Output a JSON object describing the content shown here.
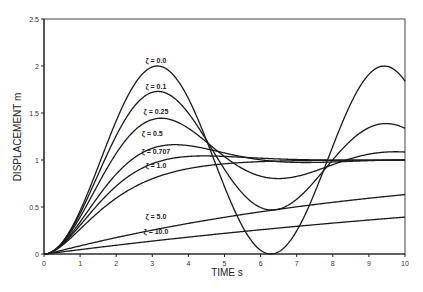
{
  "chart_data": {
    "type": "line",
    "title": "",
    "xlabel": "TIME s",
    "ylabel": "DISPLACEMENT m",
    "xlim": [
      0,
      10
    ],
    "ylim": [
      0,
      2.5
    ],
    "x_ticks": [
      "0",
      "1",
      "2",
      "3",
      "4",
      "5",
      "6",
      "7",
      "8",
      "9",
      "10"
    ],
    "y_ticks": [
      "0",
      "0.5",
      "1",
      "1.5",
      "2",
      "2.5"
    ],
    "grid": false,
    "legend": "inline labels",
    "natural_frequency_rad_s": 1,
    "x": [
      0,
      1,
      2,
      3,
      4,
      5,
      6,
      7,
      8,
      9,
      10
    ],
    "series": [
      {
        "name": "ζ = 0.0",
        "zeta": 0.0,
        "label_pos": [
          3.1,
          2.03
        ],
        "values": [
          0,
          0.46,
          1.42,
          1.99,
          1.65,
          0.72,
          0.04,
          0.25,
          1.15,
          1.91,
          1.84
        ]
      },
      {
        "name": "ζ = 0.1",
        "zeta": 0.1,
        "label_pos": [
          3.1,
          1.76
        ],
        "values": [
          0,
          0.44,
          1.32,
          1.72,
          1.44,
          0.8,
          0.46,
          0.62,
          1.1,
          1.53,
          1.41
        ]
      },
      {
        "name": "ζ = 0.25",
        "zeta": 0.25,
        "label_pos": [
          3.1,
          1.49
        ],
        "values": [
          0,
          0.42,
          1.18,
          1.44,
          1.25,
          0.92,
          0.8,
          0.89,
          1.05,
          1.13,
          1.08
        ]
      },
      {
        "name": "ζ = 0.5",
        "zeta": 0.5,
        "label_pos": [
          3.0,
          1.26
        ],
        "values": [
          0,
          0.38,
          0.98,
          1.16,
          1.1,
          1.02,
          0.99,
          0.99,
          1.0,
          1.0,
          1.0
        ]
      },
      {
        "name": "ζ = 0.707",
        "zeta": 0.707,
        "label_pos": [
          3.1,
          1.06
        ],
        "values": [
          0,
          0.34,
          0.83,
          1.02,
          1.04,
          1.02,
          1.0,
          1.0,
          1.0,
          1.0,
          1.0
        ]
      },
      {
        "name": "ζ = 1.0",
        "zeta": 1.0,
        "label_pos": [
          3.1,
          0.92
        ],
        "values": [
          0,
          0.26,
          0.59,
          0.8,
          0.91,
          0.96,
          0.98,
          0.99,
          1.0,
          1.0,
          1.0
        ]
      },
      {
        "name": "ζ = 5.0",
        "zeta": 5.0,
        "label_pos": [
          3.1,
          0.37
        ],
        "values": [
          0,
          0.09,
          0.18,
          0.26,
          0.33,
          0.39,
          0.45,
          0.5,
          0.55,
          0.59,
          0.63
        ]
      },
      {
        "name": "ζ = 10.0",
        "zeta": 10.0,
        "label_pos": [
          3.1,
          0.21
        ],
        "values": [
          0,
          0.05,
          0.1,
          0.14,
          0.18,
          0.22,
          0.26,
          0.3,
          0.33,
          0.36,
          0.39
        ]
      }
    ]
  },
  "axes": {
    "x_title": "TIME s",
    "y_title": "DISPLACEMENT m"
  },
  "colors": {
    "line": "#1a1a1a",
    "axis": "#222222",
    "background": "#ffffff"
  }
}
